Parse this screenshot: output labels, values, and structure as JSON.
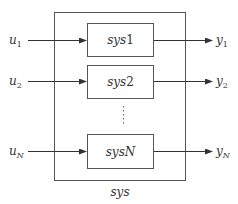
{
  "diagram": {
    "outer_label": "sys",
    "colors": {
      "line": "#444444",
      "text": "#333333",
      "background": "#ffffff"
    },
    "blocks": [
      {
        "name": "sys",
        "index": "1",
        "input": {
          "base": "u",
          "sub": "1"
        },
        "output": {
          "base": "y",
          "sub": "1"
        }
      },
      {
        "name": "sys",
        "index": "2",
        "input": {
          "base": "u",
          "sub": "2"
        },
        "output": {
          "base": "y",
          "sub": "2"
        }
      },
      {
        "name": "sys",
        "index": "N",
        "input": {
          "base": "u",
          "sub": "N"
        },
        "output": {
          "base": "y",
          "sub": "N"
        }
      }
    ],
    "ellipsis": "⋮"
  }
}
